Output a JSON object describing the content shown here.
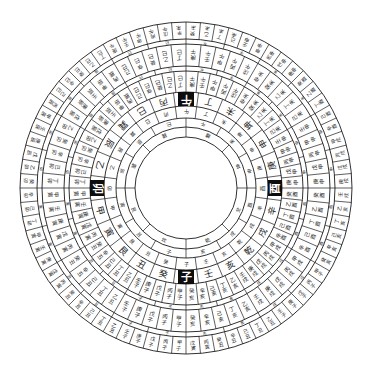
{
  "diagram": {
    "title": "",
    "type": "luopan-compass",
    "center": [
      186,
      188
    ],
    "colors": {
      "line": "#1a1a1a",
      "text": "#222222",
      "cardinal_fill": "#0d0d0d",
      "cardinal_text": "#ffffff",
      "background": "#ffffff"
    },
    "rings": [
      {
        "name": "outer-cells",
        "r_outer": 166,
        "r_inner": 149,
        "divisions": 72,
        "label_size": 5
      },
      {
        "name": "outer-thin",
        "r_outer": 149,
        "r_inner": 144,
        "divisions": 24,
        "label_size": 4
      },
      {
        "name": "sixty-jiazi-outer",
        "r_outer": 144,
        "r_inner": 122,
        "divisions": 60,
        "label_size": 5.5
      },
      {
        "name": "middle-thin",
        "r_outer": 122,
        "r_inner": 117,
        "divisions": 24,
        "label_size": 4
      },
      {
        "name": "sixty-jiazi-inner",
        "r_outer": 117,
        "r_inner": 96,
        "divisions": 60,
        "label_size": 5.5
      },
      {
        "name": "twenty-four-mountains",
        "r_outer": 96,
        "r_inner": 82,
        "divisions": 24,
        "label_size": 9
      },
      {
        "name": "inner-cells",
        "r_outer": 82,
        "r_inner": 70,
        "divisions": 24,
        "label_size": 5
      },
      {
        "name": "inner-ring-2",
        "r_outer": 70,
        "r_inner": 61,
        "divisions": 12,
        "label_size": 5
      },
      {
        "name": "inner-ring-1",
        "r_outer": 61,
        "r_inner": 51,
        "divisions": 8,
        "label_size": 5
      }
    ],
    "twenty_four_mountains": [
      "子",
      "癸",
      "丑",
      "艮",
      "寅",
      "甲",
      "卯",
      "乙",
      "辰",
      "巽",
      "巳",
      "丙",
      "午",
      "丁",
      "未",
      "坤",
      "申",
      "庚",
      "酉",
      "辛",
      "戌",
      "乾",
      "亥",
      "壬"
    ],
    "cardinals": [
      {
        "label": "子",
        "direction": "bottom",
        "angle": 90
      },
      {
        "label": "午",
        "direction": "top",
        "angle": 270
      },
      {
        "label": "卯",
        "direction": "left",
        "angle": 180
      },
      {
        "label": "酉",
        "direction": "right",
        "angle": 0
      }
    ],
    "sixty_jiazi": [
      "甲子",
      "丙子",
      "戊子",
      "庚子",
      "壬子",
      "乙丑",
      "丁丑",
      "己丑",
      "辛丑",
      "癸丑",
      "丙寅",
      "戊寅",
      "庚寅",
      "壬寅",
      "甲寅",
      "丁卯",
      "己卯",
      "辛卯",
      "癸卯",
      "乙卯",
      "戊辰",
      "庚辰",
      "壬辰",
      "甲辰",
      "丙辰",
      "己巳",
      "辛巳",
      "癸巳",
      "乙巳",
      "丁巳",
      "庚午",
      "壬午",
      "甲午",
      "丙午",
      "戊午",
      "辛未",
      "癸未",
      "乙未",
      "丁未",
      "己未",
      "壬申",
      "甲申",
      "丙申",
      "戊申",
      "庚申",
      "癸酉",
      "乙酉",
      "丁酉",
      "己酉",
      "辛酉",
      "甲戌",
      "丙戌",
      "戊戌",
      "庚戌",
      "壬戌",
      "乙亥",
      "丁亥",
      "己亥",
      "辛亥",
      "癸亥"
    ],
    "twelve_branches": [
      "子",
      "丑",
      "寅",
      "卯",
      "辰",
      "巳",
      "午",
      "未",
      "申",
      "酉",
      "戌",
      "亥"
    ],
    "eight_trigrams": [
      "坎",
      "艮",
      "震",
      "巽",
      "離",
      "坤",
      "兌",
      "乾"
    ],
    "outer_labels": [
      "子",
      "子",
      "丑",
      "丑",
      "寅",
      "寅",
      "卯",
      "卯",
      "辰",
      "辰",
      "巳",
      "巳",
      "午",
      "午",
      "未",
      "未",
      "申",
      "申",
      "酉",
      "酉",
      "戌",
      "戌",
      "亥",
      "亥"
    ]
  }
}
